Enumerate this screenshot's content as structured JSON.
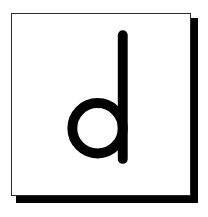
{
  "image": {
    "kind": "flashcard",
    "width": 208,
    "height": 217,
    "background_color": "#ffffff"
  },
  "card": {
    "name": "letter-card",
    "background_color": "#ffffff",
    "border_color": "#2b2b2e",
    "border_width_px": 1,
    "shadow_color": "#000000",
    "shadow_offset_x_px": 6,
    "shadow_offset_y_px": 6,
    "x": 11,
    "y": 13,
    "width": 180,
    "height": 183
  },
  "glyph": {
    "character": "d",
    "label": "lowercase letter d",
    "case": "lowercase",
    "color": "#000000",
    "style": "geometric-sans-serif",
    "stroke_width_px": 10,
    "bowl": {
      "center_x": 97,
      "center_y": 128,
      "radius": 25
    },
    "stem": {
      "x": 118,
      "top_y": 34,
      "bottom_y": 159,
      "width": 10
    }
  }
}
